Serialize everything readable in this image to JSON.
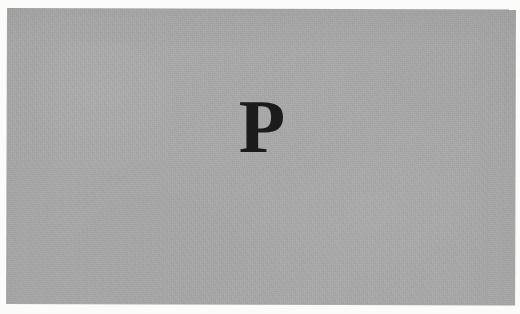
{
  "page": {
    "kind": "scanned-page",
    "background_color": "#fbfbfa"
  },
  "panel": {
    "name": "gray-panel",
    "fill_color": "#a9a9a9",
    "bounds": {
      "x": 7,
      "y": 8,
      "width": 509,
      "height": 296
    }
  },
  "content": {
    "glyph": "P",
    "glyph_color": "#1b1b1b",
    "glyph_bounds": {
      "x": 243,
      "y": 99,
      "width": 38,
      "height": 56
    }
  }
}
